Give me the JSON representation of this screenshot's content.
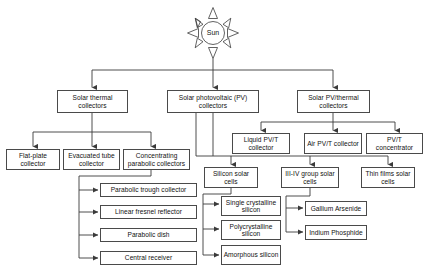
{
  "diagram": {
    "root": {
      "icon": "sun-icon",
      "label": "Sun"
    },
    "level1": [
      {
        "id": "solar-thermal-collectors",
        "label": "Solar thermal collectors"
      },
      {
        "id": "solar-photovoltaic-collectors",
        "label": "Solar photovoltaic (PV) collectors"
      },
      {
        "id": "solar-pv-thermal-collectors",
        "label": "Solar PV/thermal collectors"
      }
    ],
    "thermal_children": [
      {
        "id": "flat-plate-collector",
        "label": "Flat-plate collector"
      },
      {
        "id": "evacuated-tube-collector",
        "label": "Evacuated tube collector"
      },
      {
        "id": "concentrating-parabolic-collectors",
        "label": "Concentrating parabolic collectors"
      }
    ],
    "concentrating_children": [
      {
        "id": "parabolic-trough-collector",
        "label": "Parabolic trough collector"
      },
      {
        "id": "linear-fresnel-reflector",
        "label": "Linear fresnel reflector"
      },
      {
        "id": "parabolic-dish",
        "label": "Parabolic dish"
      },
      {
        "id": "central-receiver",
        "label": "Central receiver"
      }
    ],
    "pvt_children": [
      {
        "id": "liquid-pvt-collector",
        "label": "Liquid PV/T collector"
      },
      {
        "id": "air-pvt-collector",
        "label": "Air PV/T collector"
      },
      {
        "id": "pvt-concentrator",
        "label": "PV/T concentrator"
      }
    ],
    "pv_children": [
      {
        "id": "silicon-solar-cells",
        "label": "Silicon solar cells"
      },
      {
        "id": "iii-iv-group-solar-cells",
        "label": "III-IV group solar cells"
      },
      {
        "id": "thin-films-solar-cells",
        "label": "Thin films solar cells"
      }
    ],
    "silicon_children": [
      {
        "id": "single-crystalline-silicon",
        "label": "Single crystalline silicon"
      },
      {
        "id": "polycrystalline-silicon",
        "label": "Polycrystalline silicon"
      },
      {
        "id": "amorphous-silicon",
        "label": "Amorphous silicon"
      }
    ],
    "iii_iv_children": [
      {
        "id": "gallium-arsenide",
        "label": "Gallium Arsenide"
      },
      {
        "id": "indium-phosphide",
        "label": "Indium Phosphide"
      }
    ],
    "colors": {
      "box_border": "#4a4a4a",
      "connector": "#3a3a3a",
      "text": "#111111",
      "background": "#ffffff"
    }
  }
}
